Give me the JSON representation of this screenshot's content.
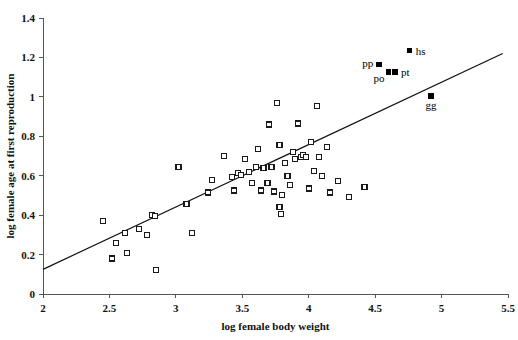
{
  "chart_data": {
    "type": "scatter",
    "title": "",
    "xlabel": "log female body weight",
    "ylabel": "log female age at first reproduction",
    "xlim": [
      2,
      5.5
    ],
    "ylim": [
      0,
      1.4
    ],
    "xticks": [
      "2",
      "2.5",
      "3",
      "3.5",
      "4",
      "4.5",
      "5",
      "5.5"
    ],
    "xtick_values": [
      2,
      2.5,
      3,
      3.5,
      4,
      4.5,
      5,
      5.5
    ],
    "yticks": [
      "0",
      "0.2",
      "0.4",
      "0.6",
      "0.8",
      "1",
      "1.2",
      "1.4"
    ],
    "ytick_values": [
      0,
      0.2,
      0.4,
      0.6,
      0.8,
      1.0,
      1.2,
      1.4
    ],
    "grid": false,
    "legend": "none",
    "marker": "open-square",
    "fit_line": {
      "label": "regression line",
      "x_start": 2.0,
      "y_start": 0.125,
      "x_end": 5.46,
      "y_end": 1.22
    },
    "points": [
      {
        "x": 2.45,
        "y": 0.37
      },
      {
        "x": 2.52,
        "y": 0.18
      },
      {
        "x": 2.55,
        "y": 0.26
      },
      {
        "x": 2.62,
        "y": 0.31
      },
      {
        "x": 2.63,
        "y": 0.21
      },
      {
        "x": 2.72,
        "y": 0.33
      },
      {
        "x": 2.78,
        "y": 0.3
      },
      {
        "x": 2.82,
        "y": 0.4
      },
      {
        "x": 2.84,
        "y": 0.395
      },
      {
        "x": 2.85,
        "y": 0.12
      },
      {
        "x": 3.02,
        "y": 0.645
      },
      {
        "x": 3.08,
        "y": 0.455
      },
      {
        "x": 3.12,
        "y": 0.31
      },
      {
        "x": 3.24,
        "y": 0.515
      },
      {
        "x": 3.27,
        "y": 0.58
      },
      {
        "x": 3.36,
        "y": 0.7
      },
      {
        "x": 3.42,
        "y": 0.595
      },
      {
        "x": 3.44,
        "y": 0.525
      },
      {
        "x": 3.47,
        "y": 0.615
      },
      {
        "x": 3.49,
        "y": 0.605
      },
      {
        "x": 3.52,
        "y": 0.685
      },
      {
        "x": 3.55,
        "y": 0.62
      },
      {
        "x": 3.57,
        "y": 0.565
      },
      {
        "x": 3.6,
        "y": 0.645
      },
      {
        "x": 3.62,
        "y": 0.735
      },
      {
        "x": 3.64,
        "y": 0.525
      },
      {
        "x": 3.66,
        "y": 0.64
      },
      {
        "x": 3.69,
        "y": 0.565
      },
      {
        "x": 3.7,
        "y": 0.86
      },
      {
        "x": 3.72,
        "y": 0.645
      },
      {
        "x": 3.74,
        "y": 0.52
      },
      {
        "x": 3.76,
        "y": 0.97
      },
      {
        "x": 3.78,
        "y": 0.755
      },
      {
        "x": 3.78,
        "y": 0.44
      },
      {
        "x": 3.79,
        "y": 0.405
      },
      {
        "x": 3.8,
        "y": 0.5
      },
      {
        "x": 3.82,
        "y": 0.665
      },
      {
        "x": 3.84,
        "y": 0.6
      },
      {
        "x": 3.86,
        "y": 0.555
      },
      {
        "x": 3.88,
        "y": 0.72
      },
      {
        "x": 3.9,
        "y": 0.685
      },
      {
        "x": 3.92,
        "y": 0.865
      },
      {
        "x": 3.94,
        "y": 0.695
      },
      {
        "x": 3.96,
        "y": 0.705
      },
      {
        "x": 3.98,
        "y": 0.695
      },
      {
        "x": 4.0,
        "y": 0.535
      },
      {
        "x": 4.02,
        "y": 0.77
      },
      {
        "x": 4.04,
        "y": 0.625
      },
      {
        "x": 4.06,
        "y": 0.955
      },
      {
        "x": 4.08,
        "y": 0.695
      },
      {
        "x": 4.1,
        "y": 0.6
      },
      {
        "x": 4.14,
        "y": 0.745
      },
      {
        "x": 4.16,
        "y": 0.515
      },
      {
        "x": 4.22,
        "y": 0.575
      },
      {
        "x": 4.3,
        "y": 0.49
      },
      {
        "x": 4.42,
        "y": 0.545
      }
    ],
    "labeled_points": [
      {
        "label": "pp",
        "x": 4.53,
        "y": 1.165,
        "label_side": "left"
      },
      {
        "label": "po",
        "x": 4.6,
        "y": 1.125,
        "label_side": "below-left"
      },
      {
        "label": "pt",
        "x": 4.65,
        "y": 1.125,
        "label_side": "right"
      },
      {
        "label": "hs",
        "x": 4.76,
        "y": 1.235,
        "label_side": "right"
      },
      {
        "label": "gg",
        "x": 4.92,
        "y": 1.005,
        "label_side": "below"
      }
    ]
  }
}
